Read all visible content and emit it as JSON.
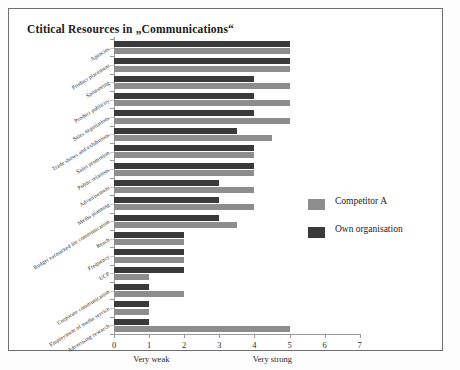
{
  "chart_data": {
    "type": "bar",
    "orientation": "horizontal",
    "title": "Ctitical Resources  in „Communications“",
    "xlabel": "",
    "ylabel": "",
    "xlim": [
      0,
      7
    ],
    "xticks": [
      0,
      1,
      2,
      3,
      4,
      5,
      6,
      7
    ],
    "grid": false,
    "legend_position": "right",
    "axis_annotations": {
      "low": "Very weak",
      "high": "Very strong"
    },
    "categories": [
      "Agencies",
      "Product placement",
      "Sponsoring",
      "Product publicity",
      "Sales negotiations",
      "Trade shows and exhibitions",
      "Sales promotion",
      "Public relations",
      "Advertisement",
      "Media planning",
      "Budget earmarked for communication",
      "Reach",
      "Frequency",
      "UCP",
      "Corporate communication",
      "Employment of media service",
      "Advertising research"
    ],
    "series": [
      {
        "name": "Own organisation",
        "color": "#3a3a3a",
        "values": [
          5,
          5,
          4,
          4,
          4,
          3.5,
          4,
          4,
          3,
          3,
          3,
          2,
          2,
          2,
          1,
          1,
          1
        ]
      },
      {
        "name": "Competitor A",
        "color": "#8d8d8d",
        "values": [
          5,
          5,
          5,
          5,
          5,
          4.5,
          4,
          4,
          4,
          4,
          3.5,
          2,
          2,
          1,
          2,
          1,
          5
        ]
      }
    ]
  },
  "legend": {
    "items": [
      {
        "label": "Competitor A",
        "color": "#8d8d8d"
      },
      {
        "label": "Own organisation",
        "color": "#3a3a3a"
      }
    ]
  }
}
